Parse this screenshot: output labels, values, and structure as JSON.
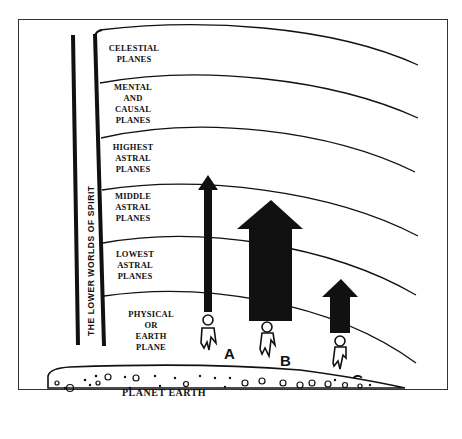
{
  "diagram": {
    "side_label": "THE LOWER WORLDS OF SPIRIT",
    "planes": [
      {
        "lines": [
          "CELESTIAL",
          "PLANES"
        ]
      },
      {
        "lines": [
          "MENTAL",
          "AND",
          "CAUSAL",
          "PLANES"
        ]
      },
      {
        "lines": [
          "HIGHEST",
          "ASTRAL",
          "PLANES"
        ]
      },
      {
        "lines": [
          "MIDDLE",
          "ASTRAL",
          "PLANES"
        ]
      },
      {
        "lines": [
          "LOWEST",
          "ASTRAL",
          "PLANES"
        ]
      },
      {
        "lines": [
          "PHYSICAL",
          "OR",
          "EARTH",
          "PLANE"
        ]
      }
    ],
    "ground_label": "PLANET EARTH",
    "figures": [
      {
        "letter": "A",
        "arrow": "thin-tall"
      },
      {
        "letter": "B",
        "arrow": "wide-large"
      },
      {
        "letter": "C",
        "arrow": "medium-small"
      }
    ],
    "colors": {
      "ink": "#111111",
      "paper": "#ffffff"
    }
  }
}
